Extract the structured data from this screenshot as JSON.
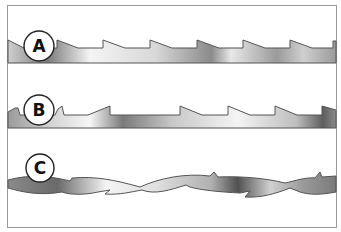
{
  "figure": {
    "blades": [
      {
        "id": "blade-a",
        "label": "A"
      },
      {
        "id": "blade-b",
        "label": "B"
      },
      {
        "id": "blade-c",
        "label": "C"
      }
    ]
  },
  "colors": {
    "frame": "#9a9a9a",
    "outline": "#555555",
    "fill_light": "#f2f2f2",
    "fill_dark": "#6e6e6e"
  }
}
